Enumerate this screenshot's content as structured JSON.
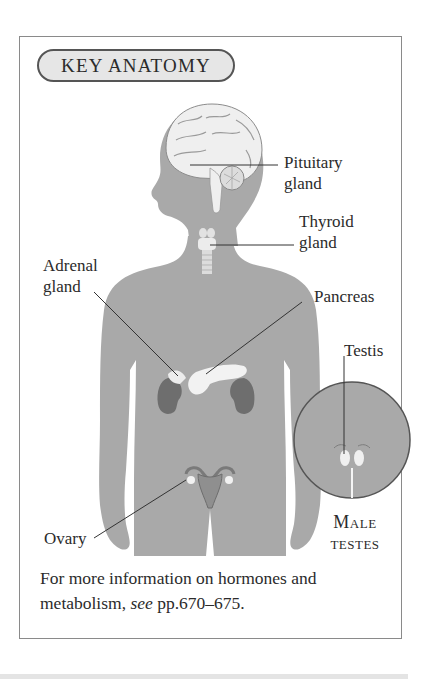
{
  "badge": {
    "title": "KEY ANATOMY"
  },
  "labels": {
    "pituitary": {
      "line1": "Pituitary",
      "line2": "gland"
    },
    "thyroid": {
      "line1": "Thyroid",
      "line2": "gland"
    },
    "adrenal": {
      "line1": "Adrenal",
      "line2": "gland"
    },
    "pancreas": {
      "line1": "Pancreas"
    },
    "testis": {
      "line1": "Testis"
    },
    "ovary": {
      "line1": "Ovary"
    },
    "inset": {
      "line1": "Male",
      "line2": "testes"
    }
  },
  "caption": {
    "part1": "For more information on hormones and metabolism, ",
    "see": "see",
    "part2": " pp.670–675."
  },
  "colors": {
    "body": "#a9a9a9",
    "organ_light": "#eeeeee",
    "kidney": "#6e6e6e",
    "frame": "#8a8a8a",
    "badge_fill": "#e6e6e6"
  }
}
